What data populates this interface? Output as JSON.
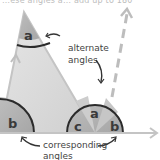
{
  "diagram": {
    "title_partial": "…ese angles a… add up to 180",
    "angles": [
      {
        "id": "top-a",
        "letter": "a"
      },
      {
        "id": "bottom-left-b",
        "letter": "b"
      },
      {
        "id": "right-a",
        "letter": "a"
      },
      {
        "id": "right-c",
        "letter": "c"
      },
      {
        "id": "right-b",
        "letter": "b"
      }
    ],
    "annotations": {
      "alternate_line1": "alternate",
      "alternate_line2": "angles",
      "corresponding_line1": "corresponding",
      "corresponding_line2": "angles"
    },
    "colors": {
      "triangle_fill": "#d9d9d9",
      "angle_fill": "#b3b3b3",
      "arc_stroke": "#2b2b2b",
      "line_stroke": "#c4c4c4",
      "text": "#444444"
    }
  }
}
